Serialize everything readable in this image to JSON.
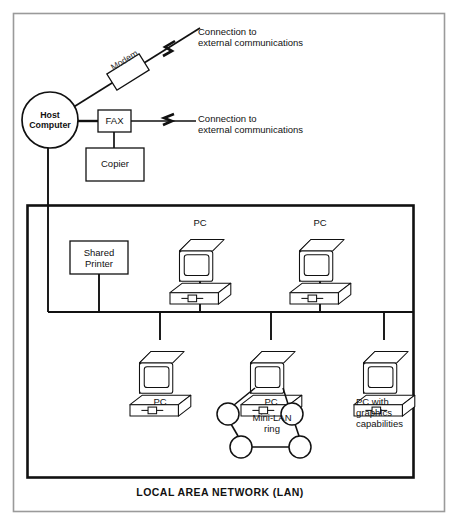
{
  "figure": {
    "type": "network-diagram",
    "caption": "LOCAL AREA NETWORK (LAN)",
    "background": "#ffffff",
    "line_color": "#111111",
    "outer_border_color": "#9a9a9a"
  },
  "nodes": {
    "host": {
      "label_line1": "Host",
      "label_line2": "Computer",
      "shape": "circle",
      "cx": 50,
      "cy": 120,
      "r": 28
    },
    "modem": {
      "label": "Modem",
      "shape": "rotated-rect"
    },
    "fax": {
      "label": "FAX",
      "shape": "rect"
    },
    "copier": {
      "label": "Copier",
      "shape": "rect"
    },
    "shared_printer": {
      "label_line1": "Shared",
      "label_line2": "Printer",
      "shape": "rect"
    }
  },
  "external_links": [
    {
      "id": "modem-link",
      "line1": "Connection to",
      "line2": "external communications",
      "break_symbol": "lightning"
    },
    {
      "id": "fax-link",
      "line1": "Connection to",
      "line2": "external communications",
      "break_symbol": "lightning"
    }
  ],
  "workstations": [
    {
      "id": "pc-top-left",
      "label": "PC",
      "label_pos": "above",
      "x": 200,
      "y": 238
    },
    {
      "id": "pc-top-right",
      "label": "PC",
      "label_pos": "above",
      "x": 320,
      "y": 238
    },
    {
      "id": "pc-bottom-left",
      "label": "PC",
      "label_pos": "below",
      "x": 160,
      "y": 350
    },
    {
      "id": "pc-bottom-mid",
      "label": "PC",
      "label_pos": "below",
      "x": 271,
      "y": 350
    },
    {
      "id": "pc-bottom-right",
      "label_lines": [
        "PC with",
        "graphics",
        "capabilities"
      ],
      "label_pos": "below",
      "x": 384,
      "y": 350
    }
  ],
  "mini_lan": {
    "label_line1": "Mini-LAN",
    "label_line2": "ring",
    "node_count": 4,
    "nodes": [
      {
        "cx": 228,
        "cy": 414,
        "r": 11
      },
      {
        "cx": 292,
        "cy": 414,
        "r": 11
      },
      {
        "cx": 241,
        "cy": 447,
        "r": 11
      },
      {
        "cx": 300,
        "cy": 447,
        "r": 11
      }
    ]
  },
  "bus": {
    "y": 312,
    "x_start": 48,
    "x_end": 413
  }
}
